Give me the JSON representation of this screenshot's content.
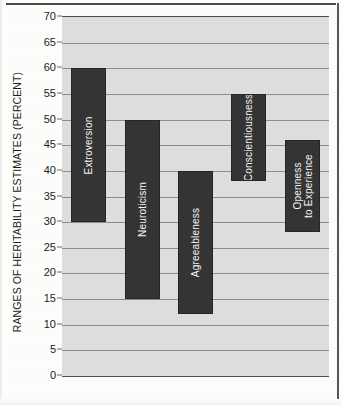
{
  "chart_data": {
    "type": "bar",
    "subtype": "floating-range-bar",
    "title": "",
    "xlabel": "",
    "ylabel": "RANGES OF HERITABILITY ESTIMATES (PERCENT)",
    "ylim": [
      0,
      70
    ],
    "ytick_step": 5,
    "yticks": [
      70,
      65,
      60,
      55,
      50,
      45,
      40,
      35,
      30,
      25,
      20,
      15,
      10,
      5,
      0
    ],
    "ytick_labels": [
      "70",
      "65",
      "60",
      "55",
      "50",
      "45",
      "40",
      "35",
      "30",
      "25",
      "20",
      "15",
      "10",
      "5",
      "0"
    ],
    "grid": true,
    "grid_axis": "y",
    "legend": false,
    "categories": [
      "Extroversion",
      "Neuroticism",
      "Agreeableness",
      "Conscientiousness",
      "Openness to Experience"
    ],
    "bars": [
      {
        "label": "Extroversion",
        "label_lines": [
          "Extroversion"
        ],
        "low": 30,
        "high": 60
      },
      {
        "label": "Neuroticism",
        "label_lines": [
          "Neuroticism"
        ],
        "low": 15,
        "high": 50
      },
      {
        "label": "Agreeableness",
        "label_lines": [
          "Agreeableness"
        ],
        "low": 12,
        "high": 40
      },
      {
        "label": "Conscientiousness",
        "label_lines": [
          "Conscientiousness"
        ],
        "low": 38,
        "high": 55
      },
      {
        "label": "Openness to Experience",
        "label_lines": [
          "Openness",
          "to Experience"
        ],
        "low": 28,
        "high": 46
      }
    ],
    "colors": {
      "bar_fill": "#343434",
      "bar_border": "#262626",
      "bar_label_text": "#f4f4f4",
      "plot_background": "#dedede",
      "gridline": "#8c8c8c",
      "axis_line": "#4d4d4d",
      "page_background": "#fdfdfc",
      "tick_text": "#1b1b1b"
    }
  },
  "caption": {
    "text": ""
  }
}
